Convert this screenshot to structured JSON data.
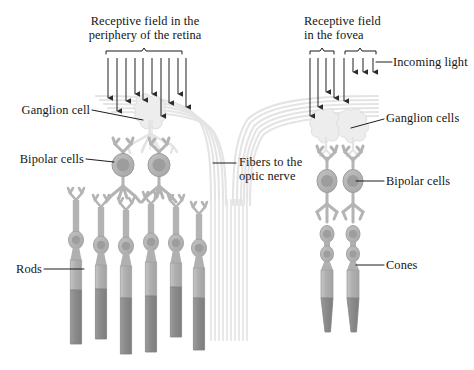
{
  "figure": {
    "type": "diagram"
  },
  "labels": {
    "periphery_title": "Receptive field in the\nperiphery of the retina",
    "fovea_title": "Receptive field\nin the fovea",
    "incoming_light": "Incoming light",
    "ganglion_cell": "Ganglion cell",
    "ganglion_cells": "Ganglion cells",
    "bipolar_cells_left": "Bipolar cells",
    "bipolar_cells_right": "Bipolar cells",
    "fibers_optic_nerve": "Fibers to the\noptic nerve",
    "rods": "Rods",
    "cones": "Cones"
  },
  "colors": {
    "background": "#ffffff",
    "text": "#141414",
    "leader_line": "#111111",
    "arrow": "#2b2b2b",
    "bracket": "#1a1a1a",
    "ganglion_fill": "#ececec",
    "ganglion_stroke": "#dcdcdc",
    "bipolar_fill": "#b7b7b7",
    "bipolar_stroke": "#9d9d9d",
    "bipolar_nucleus": "#9a9a9a",
    "photoreceptor_fill": "#b2b2b2",
    "photoreceptor_stroke": "#9a9a9a",
    "outer_segment_fill": "#8c8c8c",
    "fiber_bundle": "#e2e2e2"
  },
  "counts": {
    "periphery_light_arrows": 10,
    "fovea_long_arrows": 5,
    "fovea_short_arrows": 3,
    "periphery_ganglion_cells": 1,
    "periphery_bipolar_cells": 2,
    "rods": 6,
    "fovea_ganglion_cells": 2,
    "fovea_bipolar_cells": 2,
    "cones": 2,
    "brackets": 3
  },
  "brackets": [
    {
      "name": "periphery-bracket",
      "x1": 106,
      "x2": 182,
      "y": 50
    },
    {
      "name": "fovea-bracket-left",
      "x1": 310,
      "x2": 334,
      "y": 50
    },
    {
      "name": "fovea-bracket-right",
      "x1": 345,
      "x2": 376,
      "y": 50
    }
  ],
  "arrows": {
    "periphery": [
      {
        "x": 108,
        "y1": 58,
        "y2": 104
      },
      {
        "x": 117,
        "y1": 58,
        "y2": 117
      },
      {
        "x": 126,
        "y1": 58,
        "y2": 107
      },
      {
        "x": 135,
        "y1": 58,
        "y2": 100
      },
      {
        "x": 143,
        "y1": 58,
        "y2": 106
      },
      {
        "x": 152,
        "y1": 58,
        "y2": 100
      },
      {
        "x": 161,
        "y1": 58,
        "y2": 122
      },
      {
        "x": 169,
        "y1": 58,
        "y2": 109
      },
      {
        "x": 178,
        "y1": 58,
        "y2": 100
      },
      {
        "x": 186,
        "y1": 58,
        "y2": 113
      }
    ],
    "fovea_long": [
      {
        "x": 310,
        "y1": 58,
        "y2": 122
      },
      {
        "x": 318,
        "y1": 58,
        "y2": 113
      },
      {
        "x": 326,
        "y1": 58,
        "y2": 98
      },
      {
        "x": 334,
        "y1": 58,
        "y2": 104
      },
      {
        "x": 344,
        "y1": 58,
        "y2": 107
      }
    ],
    "fovea_short": [
      {
        "x": 353,
        "y1": 58,
        "y2": 78
      },
      {
        "x": 363,
        "y1": 58,
        "y2": 78
      },
      {
        "x": 373,
        "y1": 58,
        "y2": 78
      }
    ]
  },
  "leaders": [
    {
      "name": "ganglion-cell-leader",
      "x1": 92,
      "y1": 110,
      "x2": 140,
      "y2": 119
    },
    {
      "name": "bipolar-cells-left-leader",
      "x1": 88,
      "y1": 158,
      "x2": 122,
      "y2": 160
    },
    {
      "name": "fibers-leader",
      "x1": 213,
      "y1": 163,
      "x2": 236,
      "y2": 163
    },
    {
      "name": "rods-leader",
      "x1": 44,
      "y1": 269,
      "x2": 84,
      "y2": 269
    },
    {
      "name": "incoming-light-leader",
      "x1": 375,
      "y1": 63,
      "x2": 390,
      "y2": 63
    },
    {
      "name": "ganglion-cells-leader",
      "x1": 354,
      "y1": 126,
      "x2": 382,
      "y2": 118
    },
    {
      "name": "bipolar-cells-right-leader",
      "x1": 352,
      "y1": 181,
      "x2": 382,
      "y2": 181
    },
    {
      "name": "cones-leader",
      "x1": 352,
      "y1": 265,
      "x2": 382,
      "y2": 265
    }
  ]
}
